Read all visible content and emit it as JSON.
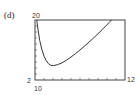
{
  "panel_label": "(d)",
  "chart_data": {
    "type": "line",
    "title": "",
    "xlabel": "",
    "ylabel": "",
    "window_labels": {
      "top": "20",
      "left": "2",
      "right": "12",
      "bottom": "10"
    },
    "xlim": [
      2,
      12
    ],
    "ylim": [
      10,
      20
    ],
    "grid": false,
    "x_ticks": 10,
    "y_ticks": 10,
    "series": [
      {
        "name": "curve",
        "x": [
          2.2,
          2.5,
          3,
          3.5,
          4,
          5,
          6,
          7,
          8,
          9,
          10,
          10.5
        ],
        "y": [
          20,
          16.5,
          13.8,
          12.6,
          12.3,
          12.8,
          13.8,
          15,
          16.3,
          17.7,
          19.2,
          20
        ]
      }
    ]
  }
}
